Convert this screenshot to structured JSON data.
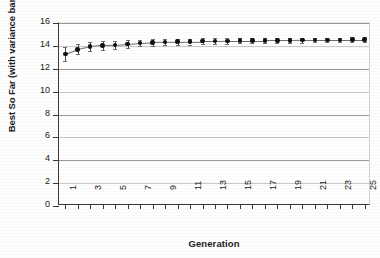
{
  "chart_data": {
    "type": "scatter",
    "title": "",
    "xlabel": "Generation",
    "ylabel": "Best So Far (with variance bars)",
    "xlim": [
      0.5,
      25.5
    ],
    "ylim": [
      0,
      16
    ],
    "ytick_values": [
      0,
      2,
      4,
      6,
      8,
      10,
      12,
      14,
      16
    ],
    "ytick_labels": [
      "0",
      "2",
      "4",
      "6",
      "8",
      "10",
      "12",
      "14",
      "16"
    ],
    "xtick_values": [
      1,
      2,
      3,
      4,
      5,
      6,
      7,
      8,
      9,
      10,
      11,
      12,
      13,
      14,
      15,
      16,
      17,
      18,
      19,
      20,
      21,
      22,
      23,
      24,
      25
    ],
    "xtick_labels": [
      "1",
      "",
      "3",
      "",
      "5",
      "",
      "7",
      "",
      "9",
      "",
      "11",
      "",
      "13",
      "",
      "15",
      "",
      "17",
      "",
      "19",
      "",
      "21",
      "",
      "23",
      "",
      "25"
    ],
    "grid": "horizontal",
    "legend": "none",
    "error_bar_label": "variance bars",
    "x": [
      1,
      2,
      3,
      4,
      5,
      6,
      7,
      8,
      9,
      10,
      11,
      12,
      13,
      14,
      15,
      16,
      17,
      18,
      19,
      20,
      21,
      22,
      23,
      24,
      25
    ],
    "values": [
      13.3,
      13.7,
      13.95,
      14.05,
      14.08,
      14.17,
      14.25,
      14.3,
      14.33,
      14.36,
      14.38,
      14.41,
      14.42,
      14.44,
      14.45,
      14.46,
      14.47,
      14.48,
      14.48,
      14.5,
      14.51,
      14.52,
      14.53,
      14.54,
      14.55
    ],
    "errors": [
      0.62,
      0.45,
      0.38,
      0.4,
      0.38,
      0.34,
      0.3,
      0.3,
      0.28,
      0.28,
      0.26,
      0.26,
      0.25,
      0.25,
      0.24,
      0.23,
      0.23,
      0.22,
      0.22,
      0.21,
      0.21,
      0.2,
      0.2,
      0.2,
      0.2
    ],
    "series_name": "Best So Far",
    "marker": "filled-circle",
    "marker_color": "#101010",
    "errorbar_color": "#4a4a4a"
  },
  "colors": {
    "background": "#ffffff",
    "axis": "#3a3a3a",
    "gridline": "#9a9a9a",
    "gridline_faint": "#c8c8c8",
    "text": "#1c1c1c"
  }
}
